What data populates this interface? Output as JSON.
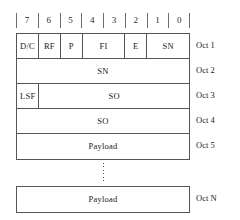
{
  "diagram": {
    "bit_header": {
      "name": "bit-position-ruler",
      "bits": [
        "7",
        "6",
        "5",
        "4",
        "3",
        "2",
        "1",
        "0"
      ]
    },
    "colors": {
      "background": "#ffffff",
      "line": "#555555",
      "ruler_tick": "#6d6d6d",
      "text": "#1a1a1a"
    },
    "head_rows": [
      {
        "octet_label": "Oct 1",
        "fields": [
          {
            "label": "D/C",
            "bits": 1
          },
          {
            "label": "RF",
            "bits": 1
          },
          {
            "label": "P",
            "bits": 1
          },
          {
            "label": "FI",
            "bits": 2
          },
          {
            "label": "E",
            "bits": 1
          },
          {
            "label": "SN",
            "bits": 2
          }
        ]
      },
      {
        "octet_label": "Oct 2",
        "fields": [
          {
            "label": "SN",
            "bits": 8
          }
        ]
      },
      {
        "octet_label": "Oct 3",
        "fields": [
          {
            "label": "LSF",
            "bits": 1
          },
          {
            "label": "SO",
            "bits": 7
          }
        ]
      },
      {
        "octet_label": "Oct 4",
        "fields": [
          {
            "label": "SO",
            "bits": 8
          }
        ]
      },
      {
        "octet_label": "Oct 5",
        "fields": [
          {
            "label": "Payload",
            "bits": 8
          }
        ]
      }
    ],
    "continuation": {
      "name": "vertical-ellipsis",
      "dot_count": 6
    },
    "tail_rows": [
      {
        "octet_label": "Oct N",
        "fields": [
          {
            "label": "Payload",
            "bits": 8
          }
        ]
      }
    ]
  }
}
